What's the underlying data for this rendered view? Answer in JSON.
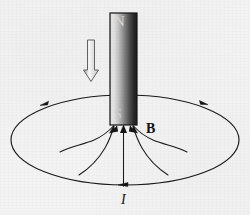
{
  "figure": {
    "background_color": "#f3f3f3",
    "width": 250,
    "height": 215
  },
  "magnet": {
    "name": "bar-magnet",
    "north_label": "N",
    "south_label": "S",
    "north_label_color": "#d9d9d9",
    "south_label_color": "#cfcfcf",
    "outline_color": "#141414",
    "gradient_light": "#ececec",
    "gradient_mid": "#9a9a9a",
    "gradient_dark": "#1f1f1f",
    "x": 110,
    "y": 13,
    "width": 27,
    "height": 112
  },
  "motion_arrow": {
    "name": "downward-motion-arrow",
    "direction": "down",
    "style": "hollow-outline",
    "stroke_color": "#5d5d5d",
    "fill_color": "#f7f7f7",
    "x": 85,
    "y": 40,
    "length": 40
  },
  "loop": {
    "name": "current-loop",
    "shape": "ellipse",
    "center_x": 125,
    "center_y": 140,
    "radius_x": 114,
    "radius_y": 45,
    "stroke_color": "#1a1a1a",
    "current_label": "I",
    "current_direction": "counterclockwise-viewed-from-above",
    "arrowhead_count": 3
  },
  "field": {
    "name": "magnetic-field-lines",
    "label": "B",
    "label_color": "#111111",
    "stroke_color": "#1a1a1a",
    "line_count": 5,
    "direction": "into-south-pole",
    "description": "Field lines converge upward into the S pole"
  },
  "labels": {
    "north": "N",
    "south": "S",
    "bfield": "B",
    "current": "I"
  }
}
